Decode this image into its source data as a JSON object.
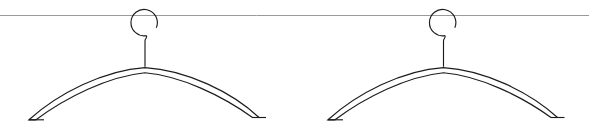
{
  "scene": {
    "title": "Two wire clothes hangers on a rod",
    "width": 589,
    "height": 133,
    "background_color": "#ffffff"
  },
  "rod": {
    "name": "horizontal rod",
    "color": "#9a9a9a",
    "stroke_width": 1,
    "y": 15.5,
    "x_start": 0,
    "x_end": 589
  },
  "style": {
    "line_color": "#1c1c1c",
    "line_width": 1.15
  },
  "hangers": [
    {
      "label": "hanger-left",
      "hook": {
        "center_x": 144.5,
        "center_y": 22.5,
        "radius": 13.2,
        "path": "M 146.5 35.6 A 13.2 13.2 0 1 1 156.3 27.8"
      },
      "neck": {
        "path": "M 146.5 35.6 C 147.6 37.6 145.0 38.4 145.0 41.0 L 145.0 66.8"
      },
      "body": {
        "peak_x": 145.0,
        "peak_y": 67.6,
        "left_tip_x": 22.0,
        "right_tip_x": 260.0,
        "tip_y": 120.0,
        "outer_path": "M 145.0 67.6 C 186.0 70.0 232.0 92.0 259.0 117.5 L 252.5 117.5 C 222.0 95.5 181.0 76.0 145.0 72.8 C 108.0 76.5 66.0 97.5 36.0 119.8 L 29.0 119.8 C 58.0 93.5 104.0 70.2 145.0 67.6 Z",
        "left_tip_path": "M 29.0 119.8 L 44.0 119.8",
        "right_tip_path": "M 252.5 117.5 L 266.0 117.5"
      }
    },
    {
      "label": "hanger-right",
      "hook": {
        "center_x": 443.0,
        "center_y": 22.5,
        "radius": 13.2,
        "path": "M 445.0 35.6 A 13.2 13.2 0 1 1 454.8 27.8"
      },
      "neck": {
        "path": "M 445.0 35.6 C 446.1 37.6 443.5 38.4 443.5 41.0 L 443.5 66.8"
      },
      "body": {
        "peak_x": 443.5,
        "peak_y": 67.6,
        "left_tip_x": 325.0,
        "right_tip_x": 562.0,
        "tip_y": 120.0,
        "outer_path": "M 443.5 67.6 C 484.0 70.0 530.0 92.0 557.5 117.5 L 551.0 117.5 C 520.5 95.5 479.5 76.0 443.5 72.8 C 406.5 76.5 365.0 97.5 335.0 119.8 L 328.0 119.8 C 357.0 93.5 402.5 70.2 443.5 67.6 Z",
        "left_tip_path": "M 328.0 119.8 L 343.0 119.8",
        "right_tip_path": "M 551.0 117.5 L 564.5 117.5"
      }
    }
  ]
}
